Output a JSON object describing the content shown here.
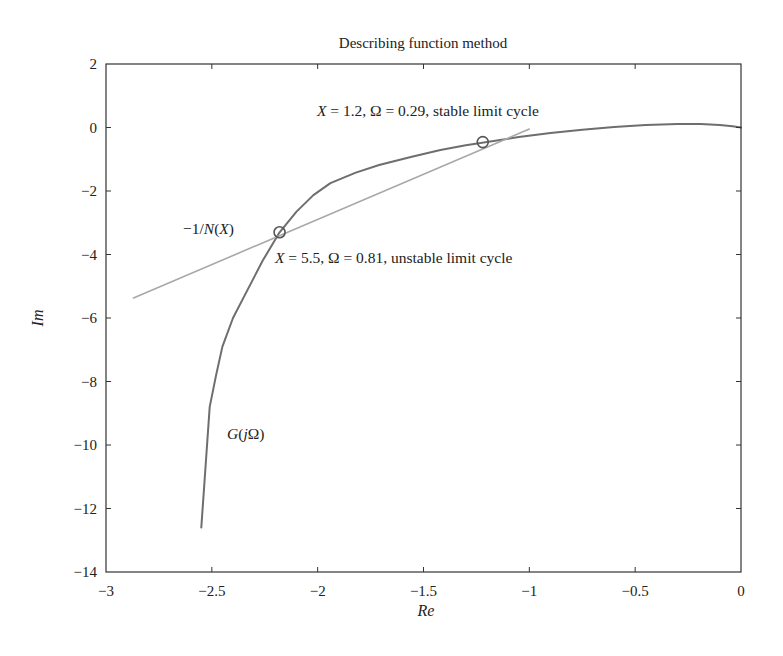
{
  "chart_data": {
    "type": "line",
    "title": "Describing function method",
    "xlabel": "Re",
    "ylabel": "Im",
    "xlim": [
      -3,
      0
    ],
    "ylim": [
      -14,
      2
    ],
    "xticks": [
      -3,
      -2.5,
      -2,
      -1.5,
      -1,
      -0.5,
      0
    ],
    "xtick_labels": [
      "−3",
      "−2.5",
      "−2",
      "−1.5",
      "−1",
      "−0.5",
      "0"
    ],
    "yticks": [
      2,
      0,
      -2,
      -4,
      -6,
      -8,
      -10,
      -12,
      -14
    ],
    "ytick_labels": [
      "2",
      "0",
      "−2",
      "−4",
      "−6",
      "−8",
      "−10",
      "−12",
      "−14"
    ],
    "grid": false,
    "legend": null,
    "series": [
      {
        "name": "G(jΩ)",
        "color": "#6e6e6e",
        "width": 2,
        "x": [
          -2.55,
          -2.53,
          -2.51,
          -2.48,
          -2.45,
          -2.4,
          -2.33,
          -2.26,
          -2.18,
          -2.1,
          -2.02,
          -1.94,
          -1.82,
          -1.71,
          -1.56,
          -1.42,
          -1.3,
          -1.2,
          -1.05,
          -0.9,
          -0.75,
          -0.6,
          -0.45,
          -0.3,
          -0.19,
          -0.1,
          -0.04,
          0.0
        ],
        "y": [
          -12.6,
          -10.7,
          -8.8,
          -7.8,
          -6.9,
          -6.0,
          -5.1,
          -4.2,
          -3.3,
          -2.65,
          -2.13,
          -1.75,
          -1.42,
          -1.18,
          -0.93,
          -0.71,
          -0.56,
          -0.46,
          -0.3,
          -0.17,
          -0.07,
          0.02,
          0.08,
          0.11,
          0.11,
          0.08,
          0.04,
          0.0
        ]
      },
      {
        "name": "−1/N(X)",
        "color": "#a8a8a8",
        "width": 1.6,
        "x": [
          -2.87,
          -1.0
        ],
        "y": [
          -5.37,
          -0.05
        ]
      }
    ],
    "markers": [
      {
        "x": -2.18,
        "y": -3.3,
        "shape": "circle",
        "label": "X = 5.5, Ω = 0.81, unstable limit cycle"
      },
      {
        "x": -1.22,
        "y": -0.46,
        "shape": "circle",
        "label": "X = 1.2, Ω = 0.29, stable limit cycle"
      }
    ],
    "annotations": [
      {
        "id": "stable",
        "parts": [
          [
            "X",
            true
          ],
          [
            " = 1.2, Ω = 0.29, stable limit cycle",
            false
          ]
        ],
        "px": 317,
        "py": 116
      },
      {
        "id": "unstable",
        "parts": [
          [
            "X",
            true
          ],
          [
            " = 5.5, Ω = 0.81, unstable limit cycle",
            false
          ]
        ],
        "px": 275,
        "py": 263
      },
      {
        "id": "neg-inv-n",
        "parts": [
          [
            "−1/",
            false
          ],
          [
            "N",
            true
          ],
          [
            "(",
            false
          ],
          [
            "X",
            true
          ],
          [
            ")",
            false
          ]
        ],
        "px": 183,
        "py": 234
      },
      {
        "id": "g-jomega",
        "parts": [
          [
            "G",
            true
          ],
          [
            "(",
            false
          ],
          [
            "j",
            true
          ],
          [
            "Ω)",
            false
          ]
        ],
        "px": 227,
        "py": 439
      }
    ]
  },
  "layout": {
    "plot_left": 106,
    "plot_right": 741,
    "plot_top": 64,
    "plot_bottom": 572,
    "axis_color": "#333333",
    "marker_color": "#555555",
    "marker_radius": 5.5
  }
}
